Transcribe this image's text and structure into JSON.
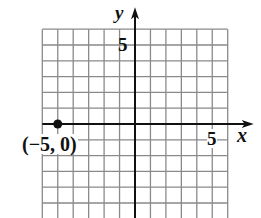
{
  "chart_data": {
    "type": "scatter",
    "title": "",
    "xlabel": "x",
    "ylabel": "y",
    "xlim": [
      -6,
      6
    ],
    "ylim": [
      -6,
      6
    ],
    "grid": true,
    "grid_step": 1,
    "tick_labels": {
      "x": [
        {
          "value": 5,
          "label": "5"
        }
      ],
      "y": [
        {
          "value": 5,
          "label": "5"
        }
      ]
    },
    "series": [
      {
        "name": "point",
        "points": [
          {
            "x": -5,
            "y": 0,
            "label": "(−5, 0)"
          }
        ]
      }
    ],
    "colors": {
      "grid": "#8a8a8a",
      "axis": "#111111",
      "point": "#111111"
    }
  },
  "labels": {
    "x_axis": "x",
    "y_axis": "y",
    "x_tick_5": "5",
    "y_tick_5": "5",
    "point_label": "(−5, 0)"
  }
}
